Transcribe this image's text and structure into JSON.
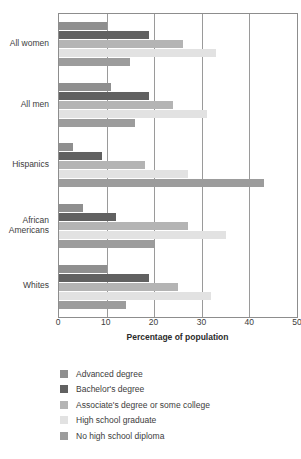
{
  "chart_data": {
    "type": "bar",
    "orientation": "horizontal",
    "title": "",
    "xlabel": "Percentage of population",
    "ylabel": "",
    "xlim": [
      0,
      50
    ],
    "xticks": [
      0,
      10,
      20,
      30,
      40,
      50
    ],
    "grid": "vertical",
    "legend_position": "bottom-left",
    "categories": [
      "All women",
      "All men",
      "Hispanics",
      "African\nAmericans",
      "Whites"
    ],
    "series": [
      {
        "name": "Advanced degree",
        "color": "#8f8f8f",
        "values": [
          10,
          11,
          3,
          5,
          10
        ]
      },
      {
        "name": "Bachelor's degree",
        "color": "#616161",
        "values": [
          19,
          19,
          9,
          12,
          19
        ]
      },
      {
        "name": "Associate's degree or some college",
        "color": "#b4b4b4",
        "values": [
          26,
          24,
          18,
          27,
          25
        ]
      },
      {
        "name": "High school graduate",
        "color": "#e2e2e2",
        "values": [
          33,
          31,
          27,
          35,
          32
        ]
      },
      {
        "name": "No high school diploma",
        "color": "#9c9c9c",
        "values": [
          15,
          16,
          43,
          20,
          14
        ]
      }
    ]
  },
  "axis": {
    "tick_labels": [
      "0",
      "10",
      "20",
      "30",
      "40",
      "50"
    ],
    "title": "Percentage of population"
  },
  "legend": {
    "items": [
      {
        "label": "Advanced degree",
        "color": "#8f8f8f"
      },
      {
        "label": "Bachelor's degree",
        "color": "#616161"
      },
      {
        "label": "Associate's degree or some college",
        "color": "#b4b4b4"
      },
      {
        "label": "High school graduate",
        "color": "#e2e2e2"
      },
      {
        "label": "No high school diploma",
        "color": "#9c9c9c"
      }
    ]
  },
  "colors": {
    "axis_line": "#8d8d8d",
    "gridline": "#9a9a9a",
    "text": "#3c3c3c",
    "background": "#ffffff"
  }
}
